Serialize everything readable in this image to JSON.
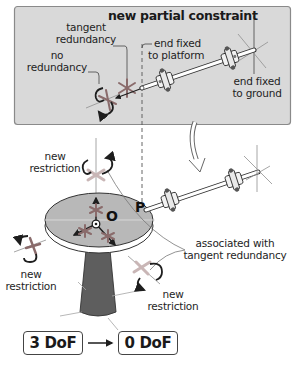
{
  "panel": {
    "title": "new partial constraint",
    "labels": {
      "tangent_redundancy": [
        "tangent",
        "redundancy"
      ],
      "no_redundancy": [
        "no",
        "redundancy"
      ],
      "end_fixed_platform": [
        "end fixed",
        "to platform"
      ],
      "end_fixed_ground": [
        "end fixed",
        "to ground"
      ]
    }
  },
  "platform": {
    "point_origin": "O",
    "point_p": "P",
    "labels": {
      "top_restriction": [
        "new",
        "restriction"
      ],
      "left_restriction": [
        "new",
        "restriction"
      ],
      "right_restriction": [
        "new",
        "restriction"
      ],
      "associated": [
        "associated with",
        "tangent redundancy"
      ]
    }
  },
  "dof": {
    "before": "3 DoF",
    "after": "0 DoF"
  },
  "colors": {
    "panel_bg": "#d9d9d9",
    "panel_border": "#8a8a8a",
    "disc_fill": "#b8b8b8",
    "cone_fill": "#5e5e5e",
    "star_color": "#8a6b6b",
    "restriction_x": "#c9b6b6",
    "line_dark": "#1e1e1e",
    "thin_line": "#8f8f8f"
  }
}
